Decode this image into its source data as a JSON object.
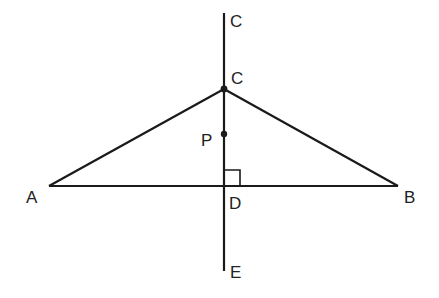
{
  "diagram": {
    "type": "geometry",
    "points": {
      "C_top": {
        "label": "C",
        "x": 224,
        "y": 13,
        "label_x": 230,
        "label_y": 27
      },
      "C": {
        "label": "C",
        "x": 224,
        "y": 89,
        "label_x": 231,
        "label_y": 84
      },
      "P": {
        "label": "P",
        "x": 224,
        "y": 134,
        "label_x": 201,
        "label_y": 146
      },
      "A": {
        "label": "A",
        "x": 49,
        "y": 186,
        "label_x": 26,
        "label_y": 203
      },
      "B": {
        "label": "B",
        "x": 398,
        "y": 186,
        "label_x": 404,
        "label_y": 203
      },
      "D": {
        "label": "D",
        "x": 224,
        "y": 186,
        "label_x": 229,
        "label_y": 209
      },
      "E": {
        "label": "E",
        "x": 224,
        "y": 271,
        "label_x": 230,
        "label_y": 278
      }
    },
    "segments": [
      {
        "from": "C_top",
        "to": "E",
        "name": "vertical-line-CE"
      },
      {
        "from": "A",
        "to": "B",
        "name": "base-AB"
      },
      {
        "from": "A",
        "to": "C",
        "name": "side-AC"
      },
      {
        "from": "C",
        "to": "B",
        "name": "side-CB"
      }
    ],
    "right_angle_marker": {
      "at": "D",
      "size": 16
    },
    "dots": [
      "C",
      "P"
    ],
    "colors": {
      "line": "#1a1a1a",
      "text": "#222222",
      "background": "#ffffff"
    }
  }
}
